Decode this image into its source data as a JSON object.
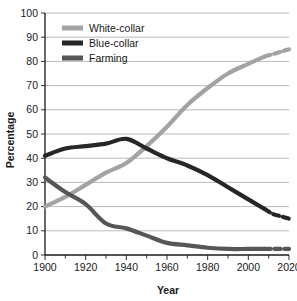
{
  "chart_data": {
    "type": "line",
    "title": "",
    "xlabel": "Year",
    "ylabel": "Percentage",
    "xlim": [
      1900,
      2020
    ],
    "ylim": [
      0,
      100
    ],
    "xticks": [
      1900,
      1920,
      1940,
      1960,
      1980,
      2000,
      2020
    ],
    "xtick_labels": [
      "1900",
      "1920",
      "1940",
      "1960",
      "1980",
      "2000",
      "2020"
    ],
    "yticks": [
      0,
      10,
      20,
      30,
      40,
      50,
      60,
      70,
      80,
      90,
      100
    ],
    "ytick_labels": [
      "0",
      "10",
      "20",
      "30",
      "40",
      "50",
      "60",
      "70",
      "80",
      "90",
      "100"
    ],
    "minor_xtick_step": 10,
    "grid": "horizontal",
    "legend_position": "upper-left-inside",
    "series": [
      {
        "name": "White-collar",
        "color": "#a3a3a3",
        "width": 4.2,
        "x": [
          1900,
          1910,
          1920,
          1930,
          1940,
          1950,
          1960,
          1970,
          1980,
          1990,
          2000,
          2008
        ],
        "values": [
          20,
          24,
          29,
          34,
          38,
          45,
          53,
          62,
          69,
          75,
          79,
          82
        ],
        "projection": {
          "style": "dashed",
          "x": [
            2008,
            2012,
            2016,
            2020
          ],
          "values": [
            82,
            83,
            84,
            85
          ]
        }
      },
      {
        "name": "Blue-collar",
        "color": "#262626",
        "width": 4.2,
        "x": [
          1900,
          1910,
          1920,
          1930,
          1940,
          1950,
          1960,
          1970,
          1980,
          1990,
          2000,
          2008
        ],
        "values": [
          41,
          44,
          45,
          46,
          48,
          44,
          40,
          37,
          33,
          28,
          23,
          19
        ],
        "projection": {
          "style": "dashed",
          "x": [
            2008,
            2012,
            2016,
            2020
          ],
          "values": [
            19,
            17,
            16,
            15
          ]
        }
      },
      {
        "name": "Farming",
        "color": "#565656",
        "width": 4.2,
        "x": [
          1900,
          1910,
          1920,
          1930,
          1940,
          1950,
          1960,
          1970,
          1980,
          1990,
          2000,
          2008
        ],
        "values": [
          32,
          26,
          21,
          13,
          11,
          8,
          5,
          4,
          3,
          2.5,
          2.5,
          2.5
        ],
        "projection": {
          "style": "dashed",
          "x": [
            2008,
            2012,
            2016,
            2020
          ],
          "values": [
            2.5,
            2.5,
            2.5,
            2.5
          ]
        }
      }
    ]
  },
  "legend": {
    "items": [
      {
        "label": "White-collar",
        "color": "#a3a3a3"
      },
      {
        "label": "Blue-collar",
        "color": "#262626"
      },
      {
        "label": "Farming",
        "color": "#565656"
      }
    ]
  },
  "axes": {
    "x_title": "Year",
    "y_title": "Percentage"
  }
}
